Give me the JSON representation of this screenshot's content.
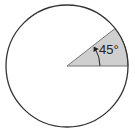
{
  "diagram": {
    "type": "circle-sector",
    "circle": {
      "cx": 67,
      "cy": 66,
      "r": 61,
      "stroke": "#333333",
      "fill": "#ffffff"
    },
    "sector": {
      "start_angle_deg": 0,
      "end_angle_deg": 38,
      "fill": "#cfcfcf",
      "stroke": "#777777"
    },
    "angle_label": "45°",
    "arc_arrow": {
      "radius": 33,
      "color": "#222222"
    }
  }
}
